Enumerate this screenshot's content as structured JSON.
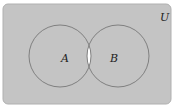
{
  "diagram": {
    "type": "venn",
    "universe_label": "U",
    "sets": [
      {
        "label": "A",
        "cx": 60,
        "cy": 56,
        "r": 31
      },
      {
        "label": "B",
        "cx": 118,
        "cy": 56,
        "r": 31
      }
    ],
    "shaded_region": "complement of A ∩ B",
    "colors": {
      "shade": "#c4c4c4",
      "unshaded": "#ffffff",
      "outline": "#808080",
      "border": "#b0b0b0"
    }
  }
}
